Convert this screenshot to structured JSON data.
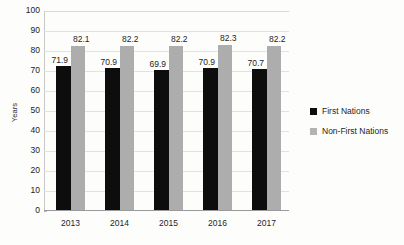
{
  "chart_data": {
    "type": "bar",
    "title": "",
    "xlabel": "",
    "ylabel": "Years",
    "ylim": [
      0,
      100
    ],
    "ytick_step": 10,
    "grid": true,
    "legend_position": "right",
    "categories": [
      "2013",
      "2014",
      "2015",
      "2016",
      "2017"
    ],
    "yticks": [
      "100",
      "90",
      "80",
      "70",
      "60",
      "50",
      "40",
      "30",
      "20",
      "10",
      "0"
    ],
    "series": [
      {
        "name": "First Nations",
        "color": "#0d0d0d",
        "values": [
          71.9,
          70.9,
          69.9,
          70.9,
          70.7
        ],
        "labels": [
          "71.9",
          "70.9",
          "69.9",
          "70.9",
          "70.7"
        ]
      },
      {
        "name": "Non-First Nations",
        "color": "#adadad",
        "values": [
          82.1,
          82.2,
          82.2,
          82.3,
          82.2
        ],
        "labels": [
          "82.1",
          "82.2",
          "82.2",
          "82.3",
          "82.2"
        ]
      }
    ]
  },
  "legend": {
    "items": [
      {
        "label": "First Nations",
        "swatch": "legend-swatch-black"
      },
      {
        "label": "Non-First Nations",
        "swatch": "legend-swatch-gray"
      }
    ]
  }
}
